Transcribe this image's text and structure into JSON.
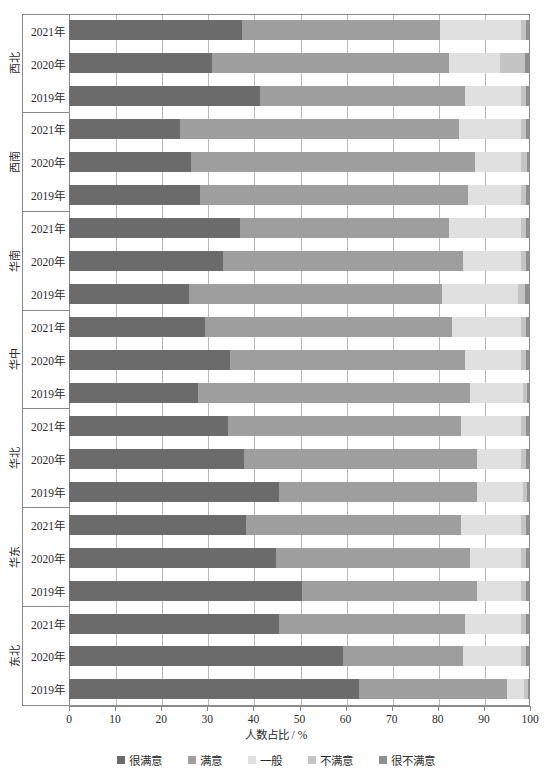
{
  "chart_data": {
    "type": "bar",
    "orientation": "horizontal",
    "stacked": true,
    "title": "",
    "xlabel": "人数占比 / %",
    "ylabel": "",
    "xlim": [
      0,
      100
    ],
    "xticks": [
      0,
      10,
      20,
      30,
      40,
      50,
      60,
      70,
      80,
      90,
      100
    ],
    "grid": true,
    "legend_position": "bottom",
    "legend": [
      "很满意",
      "满意",
      "一般",
      "不满意",
      "很不满意"
    ],
    "colors": [
      "#6b6b6b",
      "#9e9e9e",
      "#e0e0e0",
      "#c4c4c4",
      "#8f8f8f"
    ],
    "groups": [
      {
        "region": "西北",
        "rows": [
          {
            "year": "2021年",
            "values": [
              37.5,
              43.0,
              17.5,
              1.2,
              0.8
            ]
          },
          {
            "year": "2020年",
            "values": [
              31.0,
              51.5,
              11.0,
              5.5,
              1.0
            ]
          },
          {
            "year": "2019年",
            "values": [
              41.5,
              44.5,
              12.0,
              1.2,
              0.8
            ]
          }
        ]
      },
      {
        "region": "西南",
        "rows": [
          {
            "year": "2021年",
            "values": [
              24.0,
              60.5,
              13.5,
              1.2,
              0.8
            ]
          },
          {
            "year": "2020年",
            "values": [
              26.5,
              61.5,
              10.0,
              1.3,
              0.7
            ]
          },
          {
            "year": "2019年",
            "values": [
              28.5,
              58.0,
              11.5,
              1.2,
              0.8
            ]
          }
        ]
      },
      {
        "region": "华南",
        "rows": [
          {
            "year": "2021年",
            "values": [
              37.0,
              45.5,
              15.5,
              1.2,
              0.8
            ]
          },
          {
            "year": "2020年",
            "values": [
              33.5,
              52.0,
              12.5,
              1.2,
              0.8
            ]
          },
          {
            "year": "2019年",
            "values": [
              26.0,
              55.0,
              16.5,
              1.5,
              1.0
            ]
          }
        ]
      },
      {
        "region": "华中",
        "rows": [
          {
            "year": "2021年",
            "values": [
              29.5,
              53.5,
              15.0,
              1.2,
              0.8
            ]
          },
          {
            "year": "2020年",
            "values": [
              35.0,
              51.0,
              12.0,
              1.2,
              0.8
            ]
          },
          {
            "year": "2019年",
            "values": [
              28.0,
              59.0,
              11.5,
              0.9,
              0.6
            ]
          }
        ]
      },
      {
        "region": "华北",
        "rows": [
          {
            "year": "2021年",
            "values": [
              34.5,
              50.5,
              13.0,
              1.2,
              0.8
            ]
          },
          {
            "year": "2020年",
            "values": [
              38.0,
              50.5,
              9.5,
              1.2,
              0.8
            ]
          },
          {
            "year": "2019年",
            "values": [
              45.5,
              43.0,
              10.0,
              0.9,
              0.6
            ]
          }
        ]
      },
      {
        "region": "华东",
        "rows": [
          {
            "year": "2021年",
            "values": [
              38.5,
              46.5,
              13.0,
              1.2,
              0.8
            ]
          },
          {
            "year": "2020年",
            "values": [
              45.0,
              42.0,
              11.0,
              1.2,
              0.8
            ]
          },
          {
            "year": "2019年",
            "values": [
              50.5,
              38.0,
              9.5,
              1.2,
              0.8
            ]
          }
        ]
      },
      {
        "region": "东北",
        "rows": [
          {
            "year": "2021年",
            "values": [
              45.5,
              40.5,
              12.0,
              1.2,
              0.8
            ]
          },
          {
            "year": "2020年",
            "values": [
              59.5,
              26.0,
              12.5,
              1.2,
              0.8
            ]
          },
          {
            "year": "2019年",
            "values": [
              63.0,
              32.0,
              3.8,
              0.7,
              0.5
            ]
          }
        ]
      }
    ]
  }
}
